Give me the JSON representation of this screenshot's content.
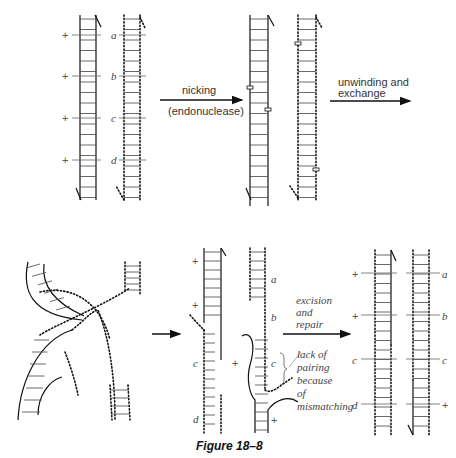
{
  "figure": {
    "caption": "Figure 18–8",
    "panels": [
      {
        "id": "initial",
        "description": "Two homologous DNA duplexes, one solid (+ markers) and one dotted (markers a, b, c, d)",
        "solid_markers": [
          "+",
          "+",
          "+",
          "+"
        ],
        "dotted_markers": [
          "a",
          "b",
          "c",
          "d"
        ]
      },
      {
        "id": "nicked",
        "description": "Both duplexes nicked by endonuclease"
      },
      {
        "id": "exchange",
        "description": "Unwound strands crossing over (Holliday-like structure)"
      },
      {
        "id": "heteroduplex",
        "description": "Heteroduplex regions with mismatching",
        "left_markers": [
          "+",
          "+",
          "c",
          "d"
        ],
        "right_markers": [
          "a",
          "b",
          "c",
          "+",
          "+"
        ]
      },
      {
        "id": "repaired",
        "description": "After excision and repair",
        "left_markers": [
          "+",
          "+",
          "c",
          "d"
        ],
        "right_markers": [
          "a",
          "b",
          "c",
          "+"
        ]
      }
    ],
    "steps": [
      {
        "label_line1": "nicking",
        "label_line2": "(endonuclease)"
      },
      {
        "label_line1": "unwinding and",
        "label_line2": "exchange"
      },
      {
        "label_line1": "excision",
        "label_line2": "and",
        "label_line3": "repair"
      }
    ],
    "annotation": {
      "lines": [
        "lack of",
        "pairing",
        "because",
        "of",
        "mismatching"
      ]
    }
  }
}
